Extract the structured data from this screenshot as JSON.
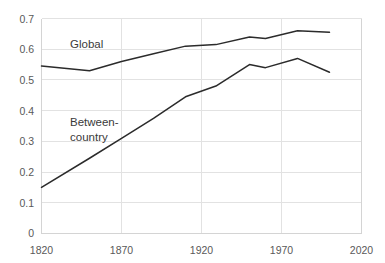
{
  "chart_data": {
    "type": "line",
    "title": "",
    "subtitle": "",
    "xlabel": "",
    "ylabel": "",
    "xlim": [
      1820,
      2020
    ],
    "ylim": [
      0,
      0.7
    ],
    "grid": true,
    "legend_position": "inline-labels",
    "x_ticks": [
      "1820",
      "1870",
      "1920",
      "1970",
      "2020"
    ],
    "x_tick_values": [
      1820,
      1870,
      1920,
      1970,
      2020
    ],
    "y_ticks": [
      "0",
      "0.1",
      "0.2",
      "0.3",
      "0.4",
      "0.5",
      "0.6",
      "0.7"
    ],
    "y_tick_values": [
      0,
      0.1,
      0.2,
      0.3,
      0.4,
      0.5,
      0.6,
      0.7
    ],
    "x": [
      1820,
      1850,
      1870,
      1890,
      1910,
      1929,
      1950,
      1960,
      1980,
      2000
    ],
    "series": [
      {
        "name": "Global",
        "label": "Global",
        "color": "#2b2b2b",
        "values": [
          0.545,
          0.53,
          0.56,
          0.585,
          0.61,
          0.615,
          0.64,
          0.635,
          0.66,
          0.655
        ]
      },
      {
        "name": "Between-country",
        "label_line1": "Between-",
        "label_line2": "country",
        "color": "#2b2b2b",
        "values": [
          0.15,
          0.245,
          0.31,
          0.375,
          0.445,
          0.48,
          0.55,
          0.54,
          0.57,
          0.525
        ]
      }
    ],
    "annotations": [
      {
        "name": "global-label",
        "text": "Global",
        "x": 1838,
        "y": 0.645
      },
      {
        "name": "between-country-label-line1",
        "text": "Between-",
        "x": 1838,
        "y": 0.395
      },
      {
        "name": "between-country-label-line2",
        "text": "country",
        "x": 1838,
        "y": 0.345
      }
    ]
  }
}
